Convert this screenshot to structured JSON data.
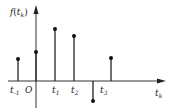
{
  "diagram": {
    "y_label": "f(t_k)",
    "y_label_main": "f",
    "y_label_arg": "t",
    "y_label_sub": "k",
    "x_label_main": "t",
    "x_label_sub": "k",
    "origin_label": "O",
    "ticks": [
      {
        "main": "t",
        "sub": "-1",
        "x": 18,
        "top": 59
      },
      {
        "main": "",
        "sub": "",
        "x": 36,
        "top": 52
      },
      {
        "main": "t",
        "sub": "1",
        "x": 55,
        "top": 29
      },
      {
        "main": "t",
        "sub": "2",
        "x": 74,
        "top": 36
      },
      {
        "main": "t",
        "sub": "3",
        "x": 93,
        "top": 101
      },
      {
        "main": "",
        "sub": "",
        "x": 111,
        "top": 58
      }
    ]
  },
  "chart_data": {
    "type": "stem",
    "title": "",
    "xlabel": "t_k",
    "ylabel": "f(t_k)",
    "categories": [
      "t_-1",
      "0",
      "t_1",
      "t_2",
      "t_3",
      "t_4"
    ],
    "values": [
      1.0,
      1.3,
      2.3,
      2.0,
      -0.9,
      1.0
    ]
  }
}
